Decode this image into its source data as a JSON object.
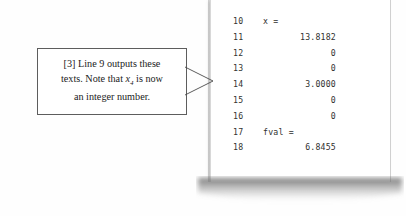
{
  "figure": {
    "kind": "scanned-textbook-figure",
    "colors": {
      "page_background": "#ffffff",
      "code_text": "#30302f",
      "callout_border": "#5d5d5d",
      "callout_text": "#1b1b1b",
      "leader_line": "#4a4a4a",
      "page_shadow": "#6b6b6b"
    }
  },
  "callout": {
    "tag": "[3]",
    "line1": "[3] Line 9 outputs these",
    "line2_before": "texts.  Note that ",
    "line2_var": "x",
    "line2_subscript": "4",
    "line2_after": " is now",
    "line3": "an integer number.",
    "full_text": "[3] Line 9 outputs these texts.  Note that x4 is now an integer number."
  },
  "code_listing": {
    "rows": [
      {
        "line_number": "10",
        "text": "x =",
        "align": "label"
      },
      {
        "line_number": "11",
        "text": "13.8182",
        "align": "number"
      },
      {
        "line_number": "12",
        "text": "0",
        "align": "number"
      },
      {
        "line_number": "13",
        "text": "0",
        "align": "number"
      },
      {
        "line_number": "14",
        "text": "3.0000",
        "align": "number"
      },
      {
        "line_number": "15",
        "text": "0",
        "align": "number"
      },
      {
        "line_number": "16",
        "text": "0",
        "align": "number"
      },
      {
        "line_number": "17",
        "text": "fval =",
        "align": "label"
      },
      {
        "line_number": "18",
        "text": "6.8455",
        "align": "number"
      }
    ]
  }
}
